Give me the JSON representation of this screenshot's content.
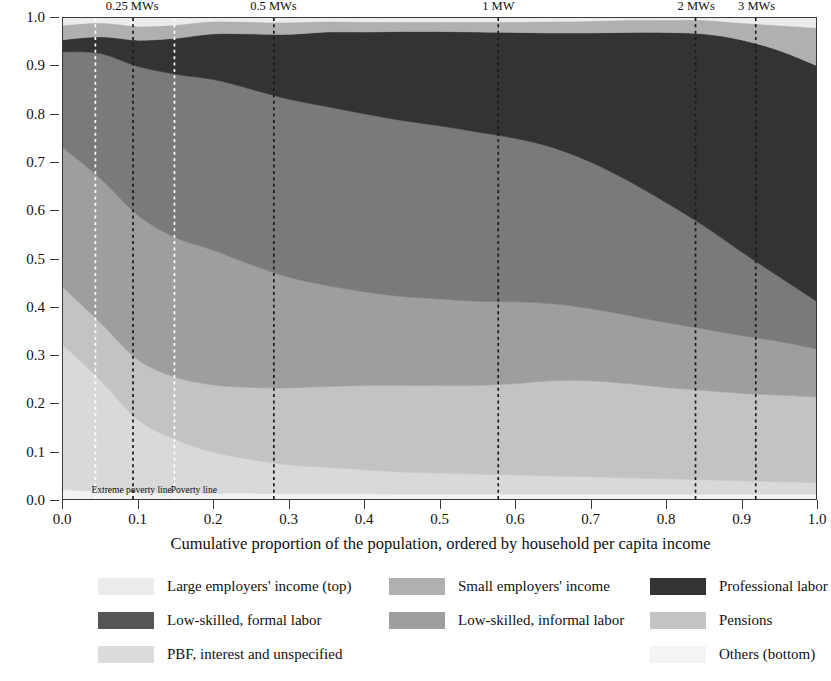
{
  "chart_data": {
    "type": "area",
    "title": "",
    "xlabel": "Cumulative proportion of the population, ordered by household per capita income",
    "ylabel": "",
    "xlim": [
      0.0,
      1.0
    ],
    "ylim": [
      0.0,
      1.0
    ],
    "grid": false,
    "stacked": true,
    "normalized": true,
    "legend_position": "bottom",
    "x_ticks": [
      "0.0",
      "0.1",
      "0.2",
      "0.3",
      "0.4",
      "0.5",
      "0.6",
      "0.7",
      "0.8",
      "0.9",
      "1.0"
    ],
    "x_tick_values": [
      0.0,
      0.1,
      0.2,
      0.3,
      0.4,
      0.5,
      0.6,
      0.7,
      0.8,
      0.9,
      1.0
    ],
    "y_ticks": [
      "0.0",
      "0.1",
      "0.2",
      "0.3",
      "0.4",
      "0.5",
      "0.6",
      "0.7",
      "0.8",
      "0.9",
      "1.0"
    ],
    "y_tick_values": [
      0.0,
      0.1,
      0.2,
      0.3,
      0.4,
      0.5,
      0.6,
      0.7,
      0.8,
      0.9,
      1.0
    ],
    "x": [
      0.0,
      0.05,
      0.1,
      0.15,
      0.2,
      0.25,
      0.3,
      0.35,
      0.4,
      0.45,
      0.5,
      0.55,
      0.6,
      0.65,
      0.7,
      0.75,
      0.8,
      0.85,
      0.9,
      0.95,
      1.0
    ],
    "series": [
      {
        "name": "Others (bottom)",
        "color": "#f2f2f2",
        "order": 1,
        "values": [
          0.02,
          0.016,
          0.014,
          0.013,
          0.012,
          0.012,
          0.011,
          0.011,
          0.011,
          0.01,
          0.01,
          0.01,
          0.01,
          0.01,
          0.01,
          0.01,
          0.01,
          0.01,
          0.01,
          0.01,
          0.01
        ]
      },
      {
        "name": "PBF, interest and unspecified",
        "color": "#d9d9d9",
        "order": 2,
        "values": [
          0.3,
          0.23,
          0.15,
          0.11,
          0.085,
          0.07,
          0.06,
          0.055,
          0.05,
          0.046,
          0.044,
          0.042,
          0.04,
          0.038,
          0.036,
          0.034,
          0.032,
          0.03,
          0.028,
          0.026,
          0.024
        ]
      },
      {
        "name": "Pensions",
        "color": "#c3c3c3",
        "order": 3,
        "values": [
          0.12,
          0.12,
          0.125,
          0.13,
          0.14,
          0.15,
          0.16,
          0.168,
          0.175,
          0.18,
          0.182,
          0.184,
          0.19,
          0.198,
          0.2,
          0.196,
          0.19,
          0.186,
          0.182,
          0.18,
          0.178
        ]
      },
      {
        "name": "Low-skilled, informal labor",
        "color": "#9e9e9e",
        "order": 4,
        "values": [
          0.29,
          0.3,
          0.3,
          0.29,
          0.28,
          0.255,
          0.23,
          0.21,
          0.195,
          0.185,
          0.18,
          0.175,
          0.17,
          0.16,
          0.15,
          0.142,
          0.135,
          0.128,
          0.12,
          0.112,
          0.1
        ]
      },
      {
        "name": "Low-skilled, formal labor",
        "color": "#7a7a7a",
        "order": 5,
        "values": [
          0.2,
          0.26,
          0.31,
          0.34,
          0.355,
          0.365,
          0.37,
          0.372,
          0.37,
          0.366,
          0.36,
          0.352,
          0.34,
          0.325,
          0.305,
          0.28,
          0.25,
          0.215,
          0.175,
          0.135,
          0.1
        ]
      },
      {
        "name": "Professional labor",
        "color": "#333333",
        "order": 6,
        "values": [
          0.025,
          0.035,
          0.055,
          0.075,
          0.095,
          0.115,
          0.135,
          0.155,
          0.17,
          0.185,
          0.196,
          0.208,
          0.22,
          0.238,
          0.268,
          0.308,
          0.353,
          0.398,
          0.44,
          0.47,
          0.49
        ]
      },
      {
        "name": "Small employers' income",
        "color": "#b0b0b0",
        "order": 7,
        "values": [
          0.03,
          0.029,
          0.029,
          0.028,
          0.026,
          0.025,
          0.025,
          0.022,
          0.021,
          0.02,
          0.02,
          0.021,
          0.022,
          0.024,
          0.025,
          0.026,
          0.026,
          0.029,
          0.035,
          0.052,
          0.078
        ]
      },
      {
        "name": "Large employers' income (top)",
        "color": "#ececec",
        "order": 8,
        "values": [
          0.015,
          0.01,
          0.017,
          0.014,
          0.007,
          0.008,
          0.009,
          0.007,
          0.008,
          0.008,
          0.008,
          0.008,
          0.008,
          0.007,
          0.006,
          0.004,
          0.004,
          0.004,
          0.01,
          0.015,
          0.02
        ]
      }
    ],
    "annotations": [
      {
        "id": "mw025",
        "label": "0.25 MWs",
        "x": 0.093,
        "style": "dashed-black",
        "label_position": "top"
      },
      {
        "id": "mw05",
        "label": "0.5 MWs",
        "x": 0.28,
        "style": "dashed-black",
        "label_position": "top"
      },
      {
        "id": "mw1",
        "label": "1 MW",
        "x": 0.578,
        "style": "dashed-black",
        "label_position": "top"
      },
      {
        "id": "mw2",
        "label": "2 MWs",
        "x": 0.84,
        "style": "dashed-black",
        "label_position": "top"
      },
      {
        "id": "mw3",
        "label": "3 MWs",
        "x": 0.92,
        "style": "dashed-black",
        "label_position": "top"
      },
      {
        "id": "extreme_poverty",
        "label": "Extreme poverty line",
        "x": 0.043,
        "style": "dashed-white",
        "label_position": "inside-bottom"
      },
      {
        "id": "poverty",
        "label": "Poverty line",
        "x": 0.148,
        "style": "dashed-white",
        "label_position": "inside-bottom"
      }
    ]
  },
  "xaxis": {
    "title": "Cumulative proportion of the population, ordered by household per capita income"
  },
  "legend": {
    "rows": [
      [
        {
          "label": "Large employers' income (top)",
          "color": "#ececec"
        },
        {
          "label": "Small employers' income",
          "color": "#b0b0b0"
        },
        {
          "label": "Professional labor",
          "color": "#333333"
        }
      ],
      [
        {
          "label": "Low-skilled, formal labor",
          "color": "#555555"
        },
        {
          "label": "Low-skilled, informal labor",
          "color": "#9e9e9e"
        },
        {
          "label": "Pensions",
          "color": "#c3c3c3"
        }
      ],
      [
        {
          "label": "PBF, interest and unspecified",
          "color": "#dcdcdc"
        },
        {
          "label": "Others (bottom)",
          "color": "#f4f4f4"
        }
      ]
    ]
  }
}
